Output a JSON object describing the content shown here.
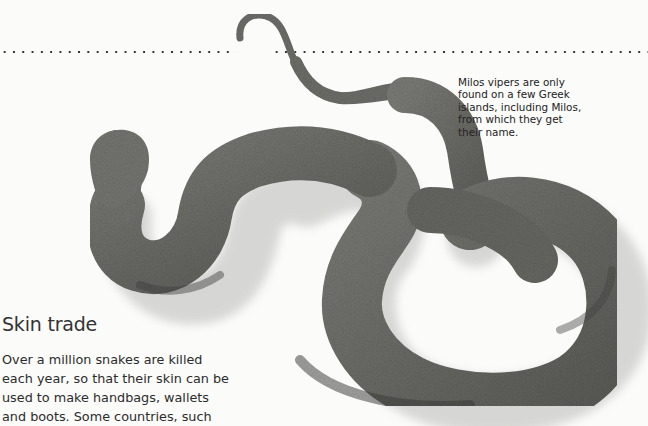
{
  "page": {
    "background": "#fbfbfa",
    "image": {
      "subject": "Milos viper photograph",
      "tone": "greyscale",
      "colors": {
        "scale_light": "#8a8a86",
        "scale_mid": "#6d6d69",
        "scale_dark": "#3e3e3b",
        "shadow": "#c8c8c6"
      }
    },
    "dotted_rule": {
      "color": "#333333"
    }
  },
  "caption": {
    "lines": [
      "Milos vipers are only",
      "found on a few Greek",
      "islands, including Milos,",
      "from which they get",
      "their name."
    ]
  },
  "article": {
    "heading": "Skin trade",
    "body_lines": [
      "Over a million snakes are killed",
      "each year, so that their skin can be",
      "used to make handbags, wallets",
      "and boots. Some countries, such"
    ]
  }
}
